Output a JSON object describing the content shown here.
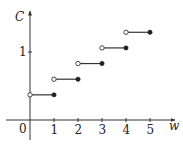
{
  "chart_data": {
    "type": "line",
    "subtype": "step",
    "title": "",
    "xlabel": "w",
    "ylabel": "C",
    "x_ticks": [
      "1",
      "2",
      "3",
      "4",
      "5"
    ],
    "y_ticks": [
      "1"
    ],
    "origin_label": "0",
    "xlim": [
      0,
      5.5
    ],
    "ylim": [
      0,
      1.5
    ],
    "grid": false,
    "legend": null,
    "steps": [
      {
        "x_start": 0,
        "x_end": 1,
        "value": 0.37,
        "start_open": true,
        "end_closed": true
      },
      {
        "x_start": 1,
        "x_end": 2,
        "value": 0.6,
        "start_open": true,
        "end_closed": true
      },
      {
        "x_start": 2,
        "x_end": 3,
        "value": 0.83,
        "start_open": true,
        "end_closed": true
      },
      {
        "x_start": 3,
        "x_end": 4,
        "value": 1.06,
        "start_open": true,
        "end_closed": true
      },
      {
        "x_start": 4,
        "x_end": 5,
        "value": 1.29,
        "start_open": true,
        "end_closed": true
      }
    ]
  },
  "axes": {
    "x_label": "w",
    "y_label": "C",
    "origin": "0",
    "x_tick_labels": [
      "1",
      "2",
      "3",
      "4",
      "5"
    ],
    "y_tick_labels": [
      "1"
    ]
  },
  "colors": {
    "axis": "#333333",
    "line": "#333333",
    "open_fill": "#ffffff",
    "closed_fill": "#222222"
  }
}
